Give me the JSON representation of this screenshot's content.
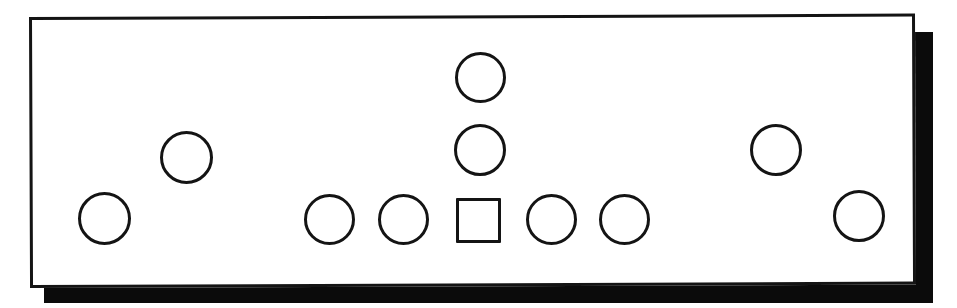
{
  "figure": {
    "title": "",
    "type": "line-drawing",
    "background_color": "#ffffff",
    "stroke_color": "#141414",
    "shadow_color": "#0b0b0b",
    "fill_color": "#ffffff"
  },
  "panel": {
    "name": "panel-outline",
    "x": 29,
    "y": 17,
    "width": 886,
    "height": 271,
    "stroke_width": 3,
    "rotation_deg": -0.22,
    "shadow": {
      "x": 44,
      "y": 32,
      "width": 889,
      "height": 271,
      "offset_x": 15,
      "offset_y": 15
    }
  },
  "shapes": [
    {
      "id": "circle-1",
      "name": "circle-port-left-outer",
      "shape": "circle",
      "cx": 104,
      "cy": 218,
      "size": 53,
      "row": "bottom"
    },
    {
      "id": "circle-2",
      "name": "circle-port-left-upper",
      "shape": "circle",
      "cx": 186,
      "cy": 157,
      "size": 53,
      "row": "middle"
    },
    {
      "id": "circle-3",
      "name": "circle-port-center-left-2",
      "shape": "circle",
      "cx": 329,
      "cy": 219,
      "size": 51,
      "row": "bottom"
    },
    {
      "id": "circle-4",
      "name": "circle-port-center-left-1",
      "shape": "circle",
      "cx": 403,
      "cy": 219,
      "size": 51,
      "row": "bottom"
    },
    {
      "id": "square-1",
      "name": "square-port-center",
      "shape": "square",
      "cx": 478,
      "cy": 220,
      "size": 45,
      "row": "bottom"
    },
    {
      "id": "circle-5",
      "name": "circle-port-center-right-1",
      "shape": "circle",
      "cx": 551,
      "cy": 219,
      "size": 51,
      "row": "bottom"
    },
    {
      "id": "circle-6",
      "name": "circle-port-center-right-2",
      "shape": "circle",
      "cx": 624,
      "cy": 219,
      "size": 51,
      "row": "bottom"
    },
    {
      "id": "circle-7",
      "name": "circle-port-center-middle",
      "shape": "circle",
      "cx": 480,
      "cy": 150,
      "size": 52,
      "row": "middle"
    },
    {
      "id": "circle-8",
      "name": "circle-port-center-top",
      "shape": "circle",
      "cx": 480,
      "cy": 77,
      "size": 51,
      "row": "top"
    },
    {
      "id": "circle-9",
      "name": "circle-port-right-upper",
      "shape": "circle",
      "cx": 776,
      "cy": 150,
      "size": 52,
      "row": "middle"
    },
    {
      "id": "circle-10",
      "name": "circle-port-right-outer",
      "shape": "circle",
      "cx": 859,
      "cy": 216,
      "size": 52,
      "row": "bottom"
    }
  ],
  "counts": {
    "circles": 10,
    "squares": 1,
    "total_shapes": 11
  }
}
